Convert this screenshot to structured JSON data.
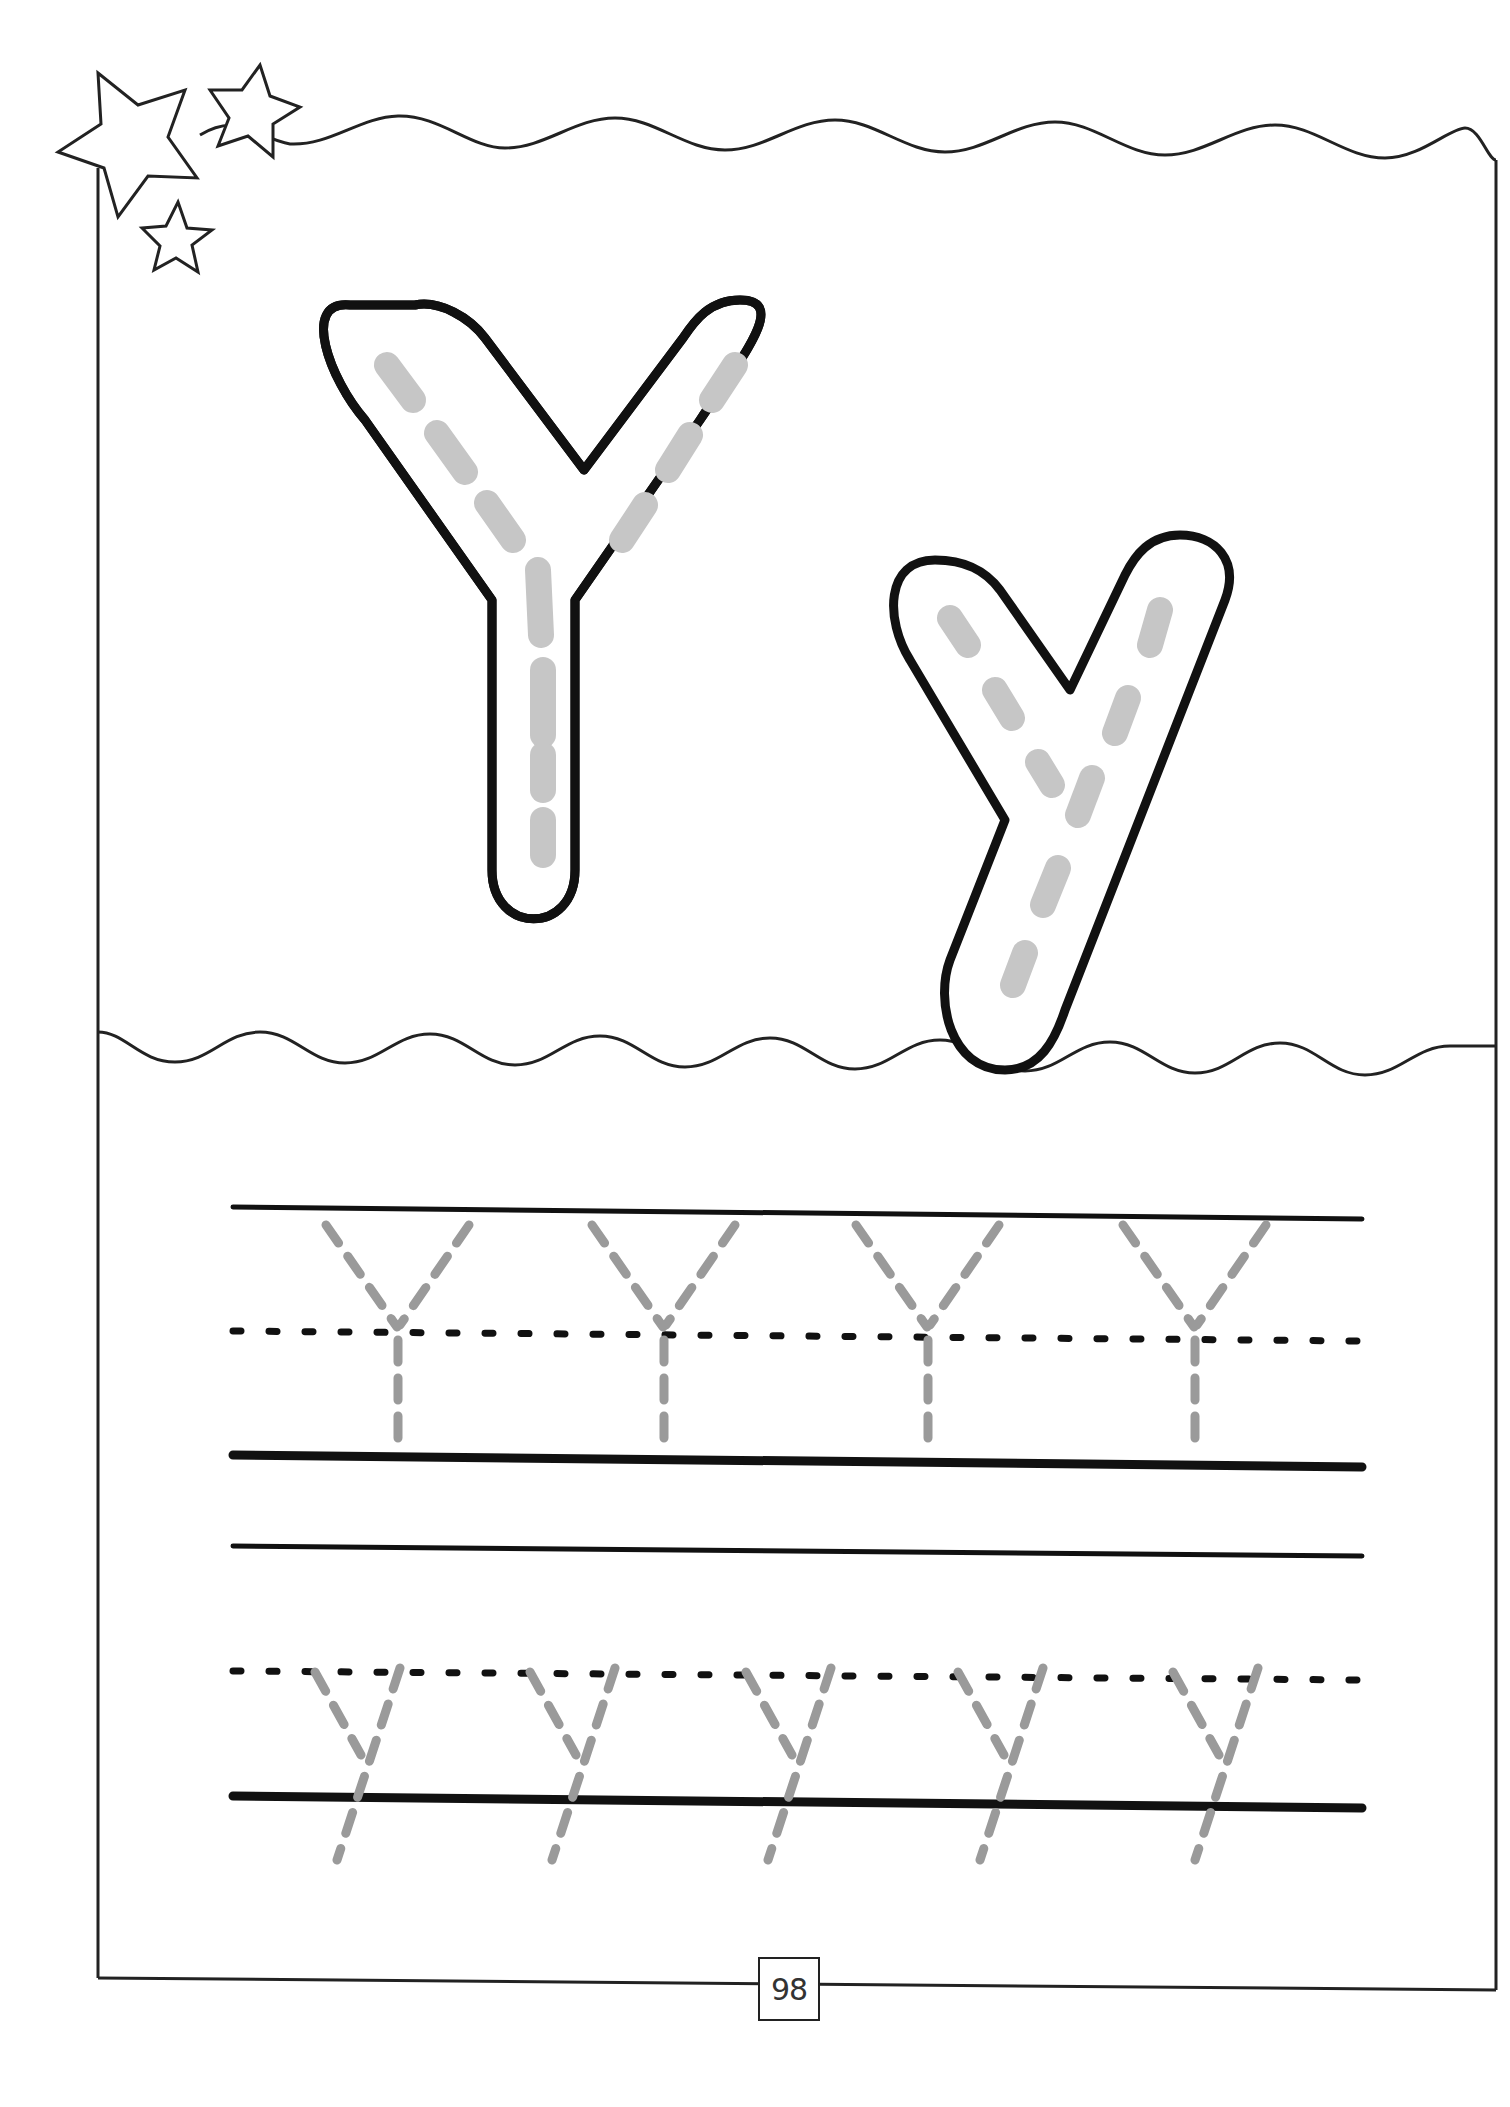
{
  "worksheet": {
    "letter_uppercase": "Y",
    "letter_lowercase": "y",
    "page_number": "98"
  },
  "decorations": {
    "stars": [
      {
        "name": "large-star",
        "cx": 135,
        "cy": 130,
        "r": 70
      },
      {
        "name": "medium-star",
        "cx": 252,
        "cy": 112,
        "r": 46
      },
      {
        "name": "small-star",
        "cx": 177,
        "cy": 240,
        "r": 36
      }
    ]
  },
  "tracing_rows": [
    {
      "case": "uppercase",
      "glyph": "Y",
      "count": 4,
      "positions_x": [
        398,
        664,
        928,
        1195
      ],
      "top_line_y": 1210,
      "mid_line_y": 1330,
      "base_line_y": 1460
    },
    {
      "case": "lowercase",
      "glyph": "y",
      "count": 5,
      "positions_x": [
        357,
        572,
        788,
        1000,
        1215
      ],
      "top_line_y": 1548,
      "mid_line_y": 1678,
      "base_line_y": 1800
    }
  ],
  "colors": {
    "outline": "#111111",
    "trace_gray": "#999999",
    "fill_gray": "#c8c8c8",
    "frame": "#222222"
  }
}
